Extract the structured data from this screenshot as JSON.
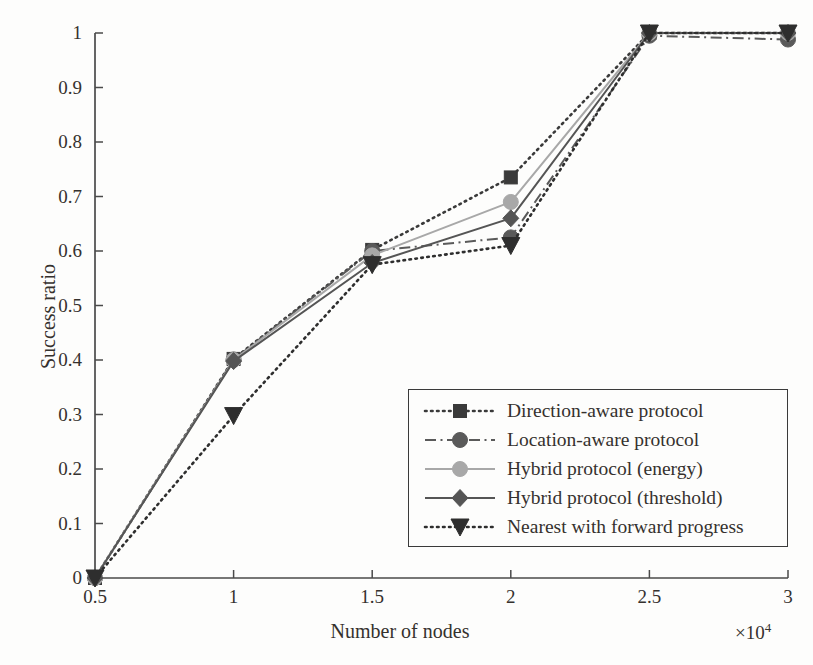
{
  "chart_data": {
    "type": "line",
    "title": "",
    "xlabel": "Number of nodes",
    "ylabel": "Success ratio",
    "x_multiplier": "×10",
    "x_multiplier_exponent": "4",
    "xlim": [
      0.5,
      3
    ],
    "ylim": [
      0,
      1
    ],
    "xticks": [
      "0.5",
      "1",
      "1.5",
      "2",
      "2.5",
      "3"
    ],
    "xtick_values": [
      0.5,
      1,
      1.5,
      2,
      2.5,
      3
    ],
    "yticks": [
      "0",
      "0.1",
      "0.2",
      "0.3",
      "0.4",
      "0.5",
      "0.6",
      "0.7",
      "0.8",
      "0.9",
      "1"
    ],
    "ytick_values": [
      0,
      0.1,
      0.2,
      0.3,
      0.4,
      0.5,
      0.6,
      0.7,
      0.8,
      0.9,
      1
    ],
    "grid": false,
    "legend_position": "lower right",
    "x": [
      0.5,
      1,
      1.5,
      2,
      2.5,
      3
    ],
    "series": [
      {
        "name": "Direction-aware protocol",
        "values": [
          0.0,
          0.402,
          0.602,
          0.735,
          1.0,
          1.0
        ],
        "color": "#3a3a3a",
        "marker": "square",
        "dash": "dotted"
      },
      {
        "name": "Location-aware protocol",
        "values": [
          0.0,
          0.401,
          0.6,
          0.625,
          0.995,
          0.988
        ],
        "color": "#5a5a5a",
        "marker": "circle",
        "dash": "dashdot"
      },
      {
        "name": "Hybrid protocol (energy)",
        "values": [
          0.0,
          0.4,
          0.592,
          0.69,
          1.0,
          1.0
        ],
        "color": "#a8a8a8",
        "marker": "circle",
        "dash": "solid"
      },
      {
        "name": "Hybrid protocol (threshold)",
        "values": [
          0.0,
          0.398,
          0.578,
          0.66,
          1.0,
          1.0
        ],
        "color": "#555555",
        "marker": "diamond",
        "dash": "solid"
      },
      {
        "name": "Nearest with forward progress",
        "values": [
          0.0,
          0.298,
          0.575,
          0.61,
          1.0,
          1.0
        ],
        "color": "#2e2e2e",
        "marker": "triangle-down",
        "dash": "dotted"
      }
    ]
  },
  "axes": {
    "ylabel": "Success ratio",
    "xlabel": "Number of nodes",
    "x_multiplier_base": "×10",
    "x_multiplier_exp": "4"
  },
  "legend": {
    "items": [
      {
        "label": "Direction-aware protocol"
      },
      {
        "label": "Location-aware protocol"
      },
      {
        "label": "Hybrid protocol (energy)"
      },
      {
        "label": "Hybrid protocol (threshold)"
      },
      {
        "label": "Nearest with forward progress"
      }
    ]
  },
  "colors": {
    "axis": "#4a4a4a",
    "text": "#35312e",
    "legend_border": "#3a3a3a",
    "background": "#fdfdfc"
  }
}
